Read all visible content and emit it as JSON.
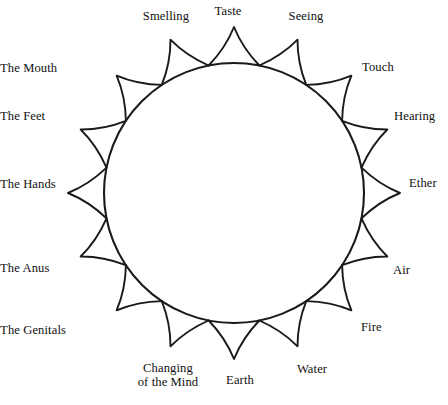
{
  "figure": {
    "background_color": "#ffffff",
    "ink_color": "#1a1a1a",
    "circle": {
      "center_x": 234,
      "center_y": 193,
      "radius": 130,
      "stroke_width": 2.1
    },
    "petals": {
      "count": 16,
      "length": 36,
      "half_width_deg": 11.25,
      "stroke_width": 1.9,
      "fill": "none"
    }
  },
  "labels": [
    {
      "text": "Taste",
      "angle_deg": 0,
      "align": "center",
      "x": 228,
      "y": 5,
      "lines": [
        "Taste"
      ]
    },
    {
      "text": "Seeing",
      "angle_deg": 22.5,
      "align": "center",
      "x": 306,
      "y": 10,
      "lines": [
        "Seeing"
      ]
    },
    {
      "text": "Touch",
      "angle_deg": 45,
      "align": "left",
      "x": 362,
      "y": 61,
      "lines": [
        "Touch"
      ]
    },
    {
      "text": "Hearing",
      "angle_deg": 67.5,
      "align": "left",
      "x": 394,
      "y": 110,
      "lines": [
        "Hearing"
      ]
    },
    {
      "text": "Ether",
      "angle_deg": 90,
      "align": "left",
      "x": 409,
      "y": 177,
      "lines": [
        "Ether"
      ]
    },
    {
      "text": "Air",
      "angle_deg": 112.5,
      "align": "left",
      "x": 393,
      "y": 264,
      "lines": [
        "Air"
      ]
    },
    {
      "text": "Fire",
      "angle_deg": 135,
      "align": "left",
      "x": 361,
      "y": 321,
      "lines": [
        "Fire"
      ]
    },
    {
      "text": "Water",
      "angle_deg": 157.5,
      "align": "center",
      "x": 312,
      "y": 363,
      "lines": [
        "Water"
      ]
    },
    {
      "text": "Earth",
      "angle_deg": 180,
      "align": "center",
      "x": 240,
      "y": 374,
      "lines": [
        "Earth"
      ]
    },
    {
      "text": "Changing of the Mind",
      "angle_deg": 202.5,
      "align": "center",
      "x": 168,
      "y": 362,
      "lines": [
        "Changing",
        "of the Mind"
      ]
    },
    {
      "text": "The Genitals",
      "angle_deg": 225,
      "align": "right",
      "x": 66,
      "y": 324,
      "lines": [
        "The Genitals"
      ]
    },
    {
      "text": "The Anus",
      "angle_deg": 247.5,
      "align": "right",
      "x": 32,
      "y": 262,
      "lines": [
        "The Anus"
      ]
    },
    {
      "text": "The Hands",
      "angle_deg": 270,
      "align": "right",
      "x": 5,
      "y": 178,
      "lines": [
        "The Hands"
      ]
    },
    {
      "text": "The Feet",
      "angle_deg": 292.5,
      "align": "right",
      "x": 22,
      "y": 110,
      "lines": [
        "The Feet"
      ]
    },
    {
      "text": "The Mouth",
      "angle_deg": 315,
      "align": "right",
      "x": 38,
      "y": 62,
      "lines": [
        "The Mouth"
      ]
    },
    {
      "text": "Smelling",
      "angle_deg": 337.5,
      "align": "center",
      "x": 166,
      "y": 10,
      "lines": [
        "Smelling"
      ]
    }
  ],
  "caption": {
    "text": ""
  }
}
